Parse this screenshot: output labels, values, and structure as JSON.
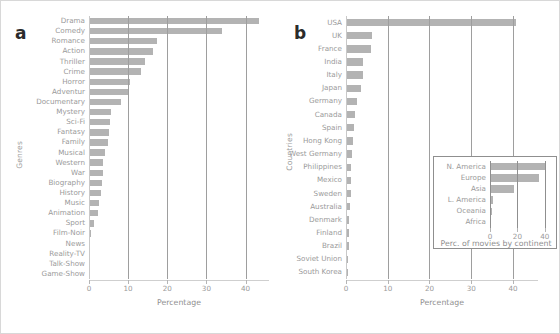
{
  "figure": {
    "panel_a_letter": "a",
    "panel_b_letter": "b"
  },
  "chart_data": [
    {
      "id": "panel_a",
      "type": "bar",
      "orientation": "horizontal",
      "title": "",
      "xlabel": "Percentage",
      "ylabel": "Genres",
      "xlim": [
        0,
        46
      ],
      "xticks": [
        0,
        10,
        20,
        30,
        40
      ],
      "grid": true,
      "legend": "none",
      "bar_color": "#b3b3b3",
      "categories": [
        "Drama",
        "Comedy",
        "Romance",
        "Action",
        "Thriller",
        "Crime",
        "Horror",
        "Adventur",
        "Documentary",
        "Mystery",
        "Sci-Fi",
        "Fantasy",
        "Family",
        "Musical",
        "Western",
        "War",
        "Biography",
        "History",
        "Music",
        "Animation",
        "Sport",
        "Film-Noir",
        "News",
        "Reality-TV",
        "Talk-Show",
        "Game-Show"
      ],
      "values": [
        43.5,
        34.0,
        17.4,
        16.3,
        14.3,
        13.3,
        10.6,
        10.3,
        8.1,
        5.6,
        5.3,
        5.1,
        4.9,
        4.0,
        3.7,
        3.6,
        3.3,
        3.1,
        2.6,
        2.4,
        1.3,
        0.5,
        0.15,
        0.1,
        0.08,
        0.06
      ]
    },
    {
      "id": "panel_b",
      "type": "bar",
      "orientation": "horizontal",
      "title": "",
      "xlabel": "Percentage",
      "ylabel": "Countries",
      "xlim": [
        0,
        46
      ],
      "xticks": [
        0,
        10,
        20,
        30,
        40
      ],
      "grid": true,
      "legend": "none",
      "bar_color": "#b3b3b3",
      "categories": [
        "USA",
        "UK",
        "France",
        "India",
        "Italy",
        "Japan",
        "Germany",
        "Canada",
        "Spain",
        "Hong Kong",
        "West Germany",
        "Philippines",
        "Mexico",
        "Sweden",
        "Australia",
        "Denmark",
        "Finland",
        "Brazil",
        "Soviet Union",
        "South Korea"
      ],
      "values": [
        40.8,
        6.3,
        6.0,
        4.1,
        4.0,
        3.5,
        2.6,
        2.2,
        2.0,
        1.7,
        1.5,
        1.3,
        1.2,
        1.1,
        1.0,
        0.8,
        0.7,
        0.6,
        0.5,
        0.45
      ]
    },
    {
      "id": "panel_b_inset",
      "type": "bar",
      "orientation": "horizontal",
      "title": "",
      "xlabel": "Perc. of movies by continent",
      "ylabel": "",
      "xlim": [
        0,
        46
      ],
      "xticks": [
        0,
        20,
        40
      ],
      "grid": true,
      "legend": "none",
      "bar_color": "#b3b3b3",
      "categories": [
        "N. America",
        "Europe",
        "Asia",
        "L. America",
        "Oceania",
        "Africa"
      ],
      "values": [
        41.0,
        36.0,
        17.5,
        2.5,
        1.4,
        0.25
      ]
    }
  ]
}
